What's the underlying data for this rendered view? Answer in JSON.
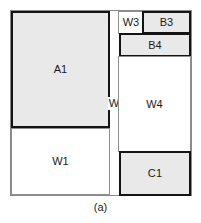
{
  "figure": {
    "caption": "(a)",
    "colors": {
      "item_fill": "#e9e9e9",
      "item_stroke": "#141414",
      "waste_fill": "#ffffff",
      "waste_stroke": "#8f8f8f",
      "background": "#ffffff",
      "text": "#1a1a1a"
    },
    "blocks": [
      {
        "id": "a1",
        "label": "A1",
        "kind": "item"
      },
      {
        "id": "w1",
        "label": "W1",
        "kind": "waste"
      },
      {
        "id": "w2",
        "label": "W2",
        "kind": "waste"
      },
      {
        "id": "w3",
        "label": "W3",
        "kind": "waste"
      },
      {
        "id": "b3",
        "label": "B3",
        "kind": "item"
      },
      {
        "id": "b4",
        "label": "B4",
        "kind": "item"
      },
      {
        "id": "w4",
        "label": "W4",
        "kind": "waste"
      },
      {
        "id": "c1",
        "label": "C1",
        "kind": "item"
      }
    ]
  }
}
